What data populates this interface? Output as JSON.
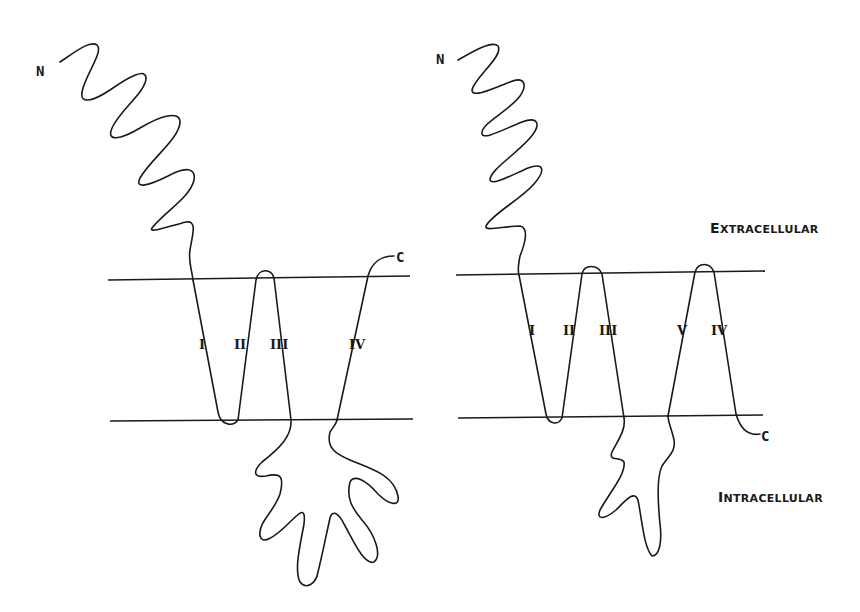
{
  "diagram": {
    "type": "membrane-topology",
    "regions": {
      "extracellular": {
        "first": "E",
        "rest": "XTRACELLULAR"
      },
      "intracellular": {
        "first": "I",
        "rest": "NTRACELLULAR"
      }
    },
    "models": [
      {
        "id": "left",
        "n_terminus": "N",
        "c_terminus": "C",
        "segments": [
          "I",
          "II",
          "III",
          "IV"
        ]
      },
      {
        "id": "right",
        "n_terminus": "N",
        "c_terminus": "C",
        "segments": [
          "I",
          "II",
          "III",
          "V",
          "IV"
        ]
      }
    ],
    "colors": {
      "ink": "#1a1a1a",
      "background": "#ffffff"
    }
  }
}
